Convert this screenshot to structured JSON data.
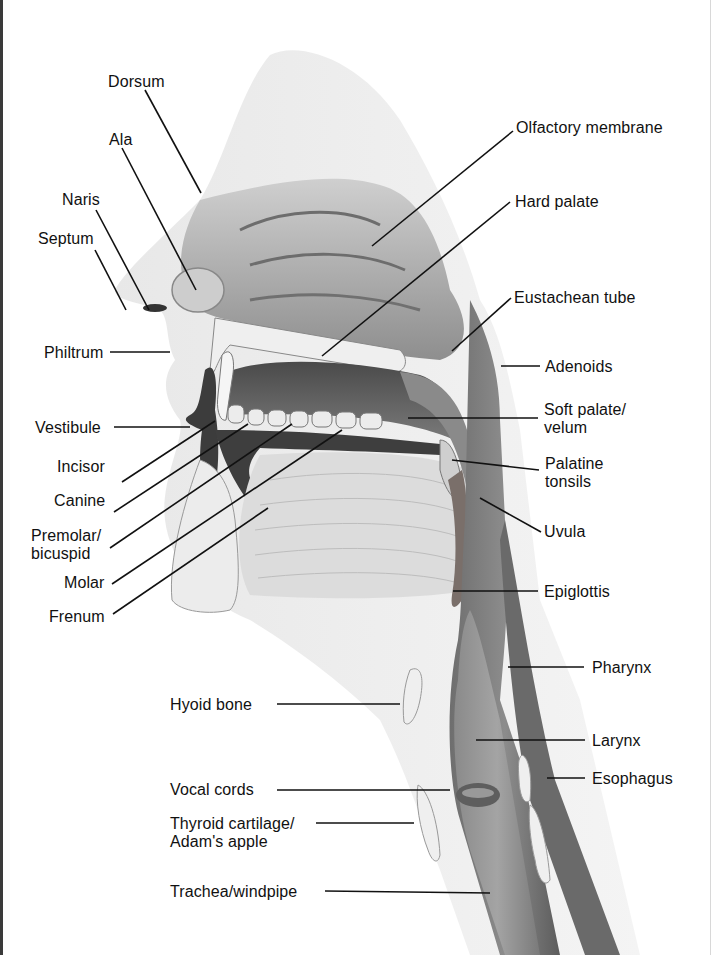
{
  "diagram": {
    "type": "anatomical sagittal section",
    "colors": {
      "tissue_dark": "#5a5a5a",
      "tissue_mid": "#9a9a9a",
      "tissue_light": "#d6d6d6",
      "skin": "#e4e4e4",
      "leader": "#111111",
      "border": "#3a3a3a"
    }
  },
  "labels": {
    "left": [
      {
        "id": "dorsum",
        "text": "Dorsum"
      },
      {
        "id": "ala",
        "text": "Ala"
      },
      {
        "id": "naris",
        "text": "Naris"
      },
      {
        "id": "septum",
        "text": "Septum"
      },
      {
        "id": "philtrum",
        "text": "Philtrum"
      },
      {
        "id": "vestibule",
        "text": "Vestibule"
      },
      {
        "id": "incisor",
        "text": "Incisor"
      },
      {
        "id": "canine",
        "text": "Canine"
      },
      {
        "id": "premolar",
        "text": "Premolar/",
        "text2": "bicuspid"
      },
      {
        "id": "molar",
        "text": "Molar"
      },
      {
        "id": "frenum",
        "text": "Frenum"
      },
      {
        "id": "hyoid",
        "text": "Hyoid bone"
      },
      {
        "id": "vocal_cords",
        "text": "Vocal cords"
      },
      {
        "id": "thyroid",
        "text": "Thyroid cartilage/",
        "text2": "Adam's apple"
      },
      {
        "id": "trachea",
        "text": "Trachea/windpipe"
      }
    ],
    "right": [
      {
        "id": "olfactory",
        "text": "Olfactory membrane"
      },
      {
        "id": "hard_palate",
        "text": "Hard palate"
      },
      {
        "id": "eustachean",
        "text": "Eustachean tube"
      },
      {
        "id": "adenoids",
        "text": "Adenoids"
      },
      {
        "id": "soft_palate",
        "text": "Soft palate/",
        "text2": "velum"
      },
      {
        "id": "palatine",
        "text": "Palatine",
        "text2": "tonsils"
      },
      {
        "id": "uvula",
        "text": "Uvula"
      },
      {
        "id": "epiglottis",
        "text": "Epiglottis"
      },
      {
        "id": "pharynx",
        "text": "Pharynx"
      },
      {
        "id": "larynx",
        "text": "Larynx"
      },
      {
        "id": "esophagus",
        "text": "Esophagus"
      }
    ]
  }
}
